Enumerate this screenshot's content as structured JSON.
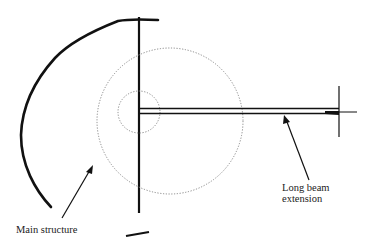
{
  "diagram": {
    "type": "structural-schematic",
    "labels": {
      "main_structure": "Main structure",
      "beam_line1": "Long beam",
      "beam_line2": "extension"
    },
    "colors": {
      "background": "#ffffff",
      "stroke": "#111111",
      "dotted": "#888888",
      "text": "#222222"
    },
    "elements": [
      "curved main structure outline",
      "vertical mast line",
      "large dotted circle",
      "small dotted circle at pivot",
      "double-line long beam extension",
      "vertical end tick at beam tip",
      "short base bar",
      "arrow pointing to main structure",
      "arrow pointing to beam"
    ]
  }
}
